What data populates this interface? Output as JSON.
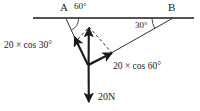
{
  "figure": {
    "type": "force-vector-diagram",
    "background_color": "#ffffff",
    "stroke_color": "#1a1a1a",
    "points": {
      "A": {
        "label": "A",
        "x": 66,
        "y": 18
      },
      "B": {
        "label": "B",
        "x": 172,
        "y": 18
      },
      "junction": {
        "label": "",
        "x": 88,
        "y": 65
      }
    },
    "baseline": {
      "name": "horizontal-line-AB",
      "x1": 33,
      "y1": 18,
      "x2": 194,
      "y2": 18
    },
    "angles": [
      {
        "name": "angle-at-A",
        "label": "60°",
        "value": 60,
        "unit": "degrees",
        "vertex": "A"
      },
      {
        "name": "angle-at-B",
        "label": "30°",
        "value": 30,
        "unit": "degrees",
        "vertex": "B"
      }
    ],
    "vectors": [
      {
        "name": "vector-toward-A",
        "label": "20 × cos 30°",
        "magnitude": "20 × cos 30°",
        "from": "junction",
        "toward": "A",
        "style": "solid",
        "arrowhead": true
      },
      {
        "name": "vector-toward-B",
        "label": "20 × cos 60°",
        "magnitude": "20 × cos 60°",
        "from": "junction",
        "toward": "B",
        "style": "solid",
        "arrowhead": true
      },
      {
        "name": "vector-resultant-up",
        "label": "",
        "from": "junction",
        "direction": "up",
        "style": "solid",
        "arrowhead": true
      },
      {
        "name": "vector-weight-down",
        "label": "20N",
        "magnitude": "20N",
        "from": "junction",
        "direction": "down",
        "style": "solid",
        "arrowhead": true
      }
    ],
    "construction_lines": [
      {
        "name": "dashed-parallel-to-AB-side",
        "style": "dashed"
      },
      {
        "name": "dashed-parallel-to-B-side",
        "style": "dashed"
      }
    ],
    "labels": {
      "point_A": "A",
      "point_B": "B",
      "angle_A": "60°",
      "angle_B": "30°",
      "component_left": "20 × cos 30°",
      "component_right": "20 × cos 60°",
      "weight": "20N"
    }
  }
}
